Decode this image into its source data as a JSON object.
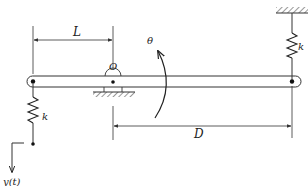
{
  "diagram": {
    "type": "mechanical-schematic",
    "colors": {
      "line": "#222222",
      "background": "#ffffff"
    },
    "labels": {
      "L": "L",
      "D": "D",
      "O": "O",
      "theta": "θ",
      "k_left": "k",
      "k_right": "k",
      "y": "y(t)"
    },
    "components": [
      {
        "id": "beam",
        "kind": "rigid-bar"
      },
      {
        "id": "pivot",
        "kind": "pin-support",
        "label": "O"
      },
      {
        "id": "spring-left",
        "kind": "spring",
        "label": "k"
      },
      {
        "id": "spring-right",
        "kind": "spring",
        "label": "k"
      },
      {
        "id": "ground-right",
        "kind": "fixed-ceiling"
      },
      {
        "id": "ground-pivot",
        "kind": "fixed-ground"
      },
      {
        "id": "input",
        "kind": "displacement-input",
        "label": "y(t)"
      },
      {
        "id": "rotation",
        "kind": "angular-coordinate",
        "label": "θ"
      }
    ],
    "dimensions": [
      {
        "label": "L",
        "from": "left end",
        "to": "pivot O"
      },
      {
        "label": "D",
        "from": "pivot O",
        "to": "right end"
      }
    ]
  }
}
